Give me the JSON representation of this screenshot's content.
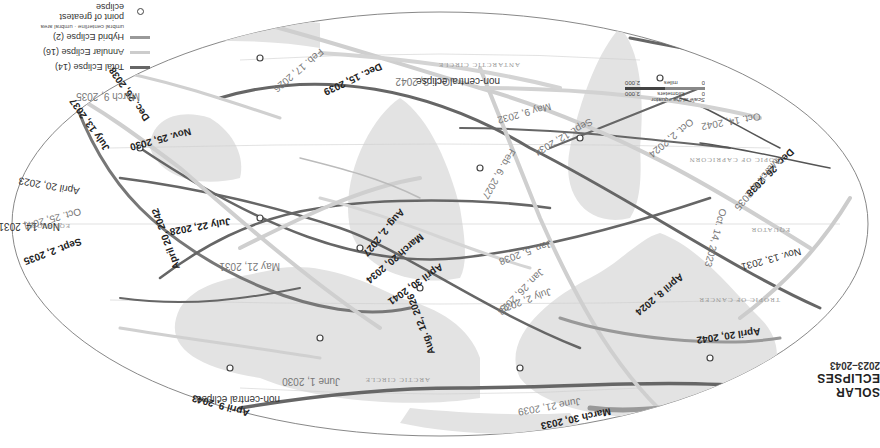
{
  "title": {
    "main": "SOLAR ECLIPSES",
    "sub": "2023–2043"
  },
  "legend": {
    "items": [
      {
        "label": "Total Eclipse (14)",
        "color": "#666666"
      },
      {
        "label": "Annular Eclipse (16)",
        "color": "#cccccc"
      },
      {
        "label": "Hybrid Eclipse (2)",
        "color": "#999999"
      },
      {
        "label": "point of greatest eclipse",
        "symbol": "circle"
      }
    ],
    "hybrid_notes": {
      "centerline": "umbral centerline",
      "area": "umbral area"
    }
  },
  "scale": {
    "caption": "Scale at the equator",
    "km_label": "kilometers",
    "km_zero": "0",
    "km_max": "3,000",
    "mi_label": "miles",
    "mi_zero": "0",
    "mi_max": "2,000"
  },
  "geo_labels": {
    "arctic": "ARCTIC CIRCLE",
    "cancer": "TROPIC OF CANCER",
    "equator": "EQUATOR",
    "capricorn": "TROPIC OF CAPRICORN",
    "antarctic": "ANTARCTIC CIRCLE"
  },
  "eclipses": {
    "apr8_2024": "April 8, 2024",
    "mar30_2033": "March 30, 2033",
    "aug12_2026": "Aug. 12, 2026",
    "apr9_2043": "April 9, 2043",
    "apr9_2043_note": "non-central eclipse",
    "jun1_2030": "June 1, 2030",
    "jun21_2039": "June 21, 2039",
    "apr20_2042_n": "April 20, 2042",
    "apr20_2042_s": "April 20, 2042",
    "sep2_2035": "Sept. 2, 2035",
    "nov14_2031": "Nov. 14, 2031",
    "nov13_2031": "Nov. 13, 2031",
    "oct14_2023": "Oct. 14, 2023",
    "oct25_2041": "Oct. 25, 2041",
    "apr20_2023": "April 20, 2023",
    "jul22_2028": "July 22, 2028",
    "jul13_2037": "July 13, 2037",
    "nov25_2030": "Nov. 25, 2030",
    "dec26_2038": "Dec. 26, 2038",
    "mar9_2035": "March 9, 2035",
    "feb17_2026": "Feb. 17, 2026",
    "dec15_2039": "Dec. 15, 2039",
    "oct3_2042": "Oct. 3, 2042",
    "oct3_2042_note": "non-central eclipse",
    "may9_2032": "May 9, 2032",
    "may21_2031": "May 21, 2031",
    "aug2_2027": "Aug. 2, 2027",
    "mar20_2034": "March 20, 2034",
    "apr30_2041": "April 30, 2041",
    "jan5_2038": "Jan. 5, 2038",
    "jan26_2028": "Jan. 26, 2028",
    "jul2_2038": "July 2, 2038",
    "feb6_2027": "Feb. 6, 2027",
    "sep12_2034": "Sept. 12, 2034",
    "oct2_2024": "Oct. 2, 2024",
    "oct14_2042": "Oct. 14, 2042",
    "dec26_2038b": "Dec. 26, 2038",
    "mar9_2035b": "March 9, 2035",
    "sep2_2035b": "Sept. 2, 2035"
  }
}
